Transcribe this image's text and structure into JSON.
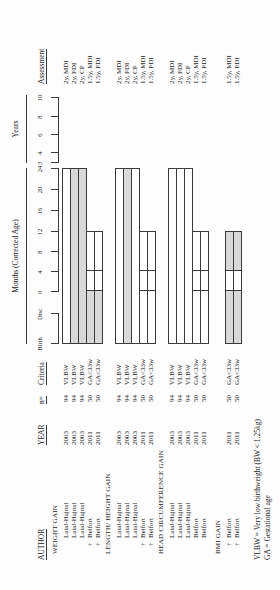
{
  "headers": {
    "author": "AUTHOR",
    "year": "YEAR",
    "n": "n=",
    "criteria": "Criteria",
    "assessment": "Assessment"
  },
  "axes": {
    "months_label": "Months (Corrected Age)",
    "years_label": "Years",
    "pre_ticks": [
      "Birth",
      "Disc"
    ],
    "month_ticks": [
      "0",
      "4",
      "8",
      "12",
      "16",
      "20",
      "24"
    ],
    "year_ticks": [
      "3",
      "4",
      "6",
      "8",
      "10"
    ]
  },
  "groups": [
    {
      "title": "WEIGHT GAIN",
      "rows": [
        {
          "dagger": "",
          "author": "Latal-Hajnal",
          "year": "2003",
          "n": "94",
          "criteria": "VLBW",
          "assessment": "2y, MDI",
          "bar": {
            "span": "birth-24m",
            "segments": [
              {
                "range": "birth-24m",
                "shaded": false
              }
            ]
          }
        },
        {
          "dagger": "",
          "author": "Latal-Hajnal",
          "year": "2003",
          "n": "94",
          "criteria": "VLBW",
          "assessment": "2y, PDI",
          "bar": {
            "span": "birth-24m",
            "segments": [
              {
                "range": "birth-24m",
                "shaded": true
              }
            ]
          }
        },
        {
          "dagger": "",
          "author": "Latal-Hajnal",
          "year": "2003",
          "n": "94",
          "criteria": "VLBW",
          "assessment": "2y, CP",
          "bar": {
            "span": "birth-24m",
            "segments": [
              {
                "range": "birth-24m",
                "shaded": true
              }
            ]
          }
        },
        {
          "dagger": "†",
          "author": "Belfort",
          "year": "2011",
          "n": "50",
          "criteria": "GA<33w",
          "assessment": "1.5y, MDI",
          "bar": {
            "span": "birth-12m",
            "segments": [
              {
                "range": "birth-0m",
                "shaded": true
              },
              {
                "range": "0-4m",
                "shaded": false
              },
              {
                "range": "4-12m",
                "shaded": false
              }
            ]
          }
        },
        {
          "dagger": "†",
          "author": "Belfort",
          "year": "2011",
          "n": "50",
          "criteria": "GA<33w",
          "assessment": "1.5y, PDI",
          "bar": {
            "span": "birth-12m",
            "segments": [
              {
                "range": "birth-0m",
                "shaded": true
              },
              {
                "range": "0-4m",
                "shaded": false
              },
              {
                "range": "4-12m",
                "shaded": false
              }
            ]
          }
        }
      ]
    },
    {
      "title": "LENGTH/ HEIGHT GAIN",
      "rows": [
        {
          "dagger": "",
          "author": "Latal-Hajnal",
          "year": "2003",
          "n": "94",
          "criteria": "VLBW",
          "assessment": "2y, MDI",
          "bar": {
            "span": "birth-24m",
            "segments": [
              {
                "range": "birth-24m",
                "shaded": false
              }
            ]
          }
        },
        {
          "dagger": "",
          "author": "Latal-Hajnal",
          "year": "2003",
          "n": "94",
          "criteria": "VLBW",
          "assessment": "2y, PDI",
          "bar": {
            "span": "birth-24m",
            "segments": [
              {
                "range": "birth-24m",
                "shaded": true
              }
            ]
          }
        },
        {
          "dagger": "",
          "author": "Latal-Hajnal",
          "year": "2003",
          "n": "94",
          "criteria": "VLBW",
          "assessment": "2y, CP",
          "bar": {
            "span": "birth-24m",
            "segments": [
              {
                "range": "birth-24m",
                "shaded": false
              }
            ]
          }
        },
        {
          "dagger": "†",
          "author": "Belfort",
          "year": "2011",
          "n": "50",
          "criteria": "GA<33w",
          "assessment": "1.5y, MDI",
          "bar": {
            "span": "birth-12m",
            "segments": [
              {
                "range": "birth-0m",
                "shaded": false
              },
              {
                "range": "0-4m",
                "shaded": false
              },
              {
                "range": "4-12m",
                "shaded": false
              }
            ]
          }
        },
        {
          "dagger": "†",
          "author": "Belfort",
          "year": "2011",
          "n": "50",
          "criteria": "GA<33w",
          "assessment": "1.5y, PDI",
          "bar": {
            "span": "birth-12m",
            "segments": [
              {
                "range": "birth-0m",
                "shaded": false
              },
              {
                "range": "0-4m",
                "shaded": false
              },
              {
                "range": "4-12m",
                "shaded": false
              }
            ]
          }
        }
      ]
    },
    {
      "title": "HEAD CIRCUMFERENCE GAIN",
      "rows": [
        {
          "dagger": "",
          "author": "Latal-Hajnal",
          "year": "2003",
          "n": "94",
          "criteria": "VLBW",
          "assessment": "2y, MDI",
          "bar": {
            "span": "birth-24m",
            "segments": [
              {
                "range": "birth-24m",
                "shaded": false
              }
            ]
          }
        },
        {
          "dagger": "",
          "author": "Latal-Hajnal",
          "year": "2003",
          "n": "94",
          "criteria": "VLBW",
          "assessment": "2y, PDI",
          "bar": {
            "span": "birth-24m",
            "segments": [
              {
                "range": "birth-24m",
                "shaded": false
              }
            ]
          }
        },
        {
          "dagger": "",
          "author": "Latal-Hajnal",
          "year": "2003",
          "n": "94",
          "criteria": "VLBW",
          "assessment": "2y, CP",
          "bar": {
            "span": "birth-24m",
            "segments": [
              {
                "range": "birth-24m",
                "shaded": false
              }
            ]
          }
        },
        {
          "dagger": "",
          "author": "Belfort",
          "year": "2011",
          "n": "50",
          "criteria": "GA<33w",
          "assessment": "1.5y, MDI",
          "bar": {
            "span": "birth-12m",
            "segments": [
              {
                "range": "birth-0m",
                "shaded": false
              },
              {
                "range": "0-4m",
                "shaded": false
              },
              {
                "range": "4-12m",
                "shaded": false
              }
            ]
          }
        },
        {
          "dagger": "",
          "author": "Belfort",
          "year": "2011",
          "n": "50",
          "criteria": "GA<33w",
          "assessment": "1.5y, PDI",
          "bar": {
            "span": "birth-12m",
            "segments": [
              {
                "range": "birth-0m",
                "shaded": false
              },
              {
                "range": "0-4m",
                "shaded": false
              },
              {
                "range": "4-12m",
                "shaded": false
              }
            ]
          }
        }
      ]
    },
    {
      "title": "BMI GAIN",
      "rows": [
        {
          "dagger": "†",
          "author": "Belfort",
          "year": "2011",
          "n": "50",
          "criteria": "GA<33w",
          "assessment": "1.5y, MDI",
          "bar": {
            "span": "birth-12m",
            "segments": [
              {
                "range": "birth-0m",
                "shaded": true
              },
              {
                "range": "0-4m",
                "shaded": false
              },
              {
                "range": "4-12m",
                "shaded": true
              }
            ]
          }
        },
        {
          "dagger": "†",
          "author": "Belfort",
          "year": "2011",
          "n": "50",
          "criteria": "GA<33w",
          "assessment": "1.5y, PDI",
          "bar": {
            "span": "birth-12m",
            "segments": [
              {
                "range": "birth-0m",
                "shaded": true
              },
              {
                "range": "0-4m",
                "shaded": false
              },
              {
                "range": "4-12m",
                "shaded": true
              }
            ]
          }
        }
      ]
    }
  ],
  "footnotes": [
    "VLBW = Very low birthweight (BW < 1.25kg)",
    "GA = Gestational age"
  ],
  "colors": {
    "outline": "#3a3a3a",
    "shaded_fill": "#d9d9d9",
    "plain_fill": "#ffffff",
    "text": "#222222"
  }
}
